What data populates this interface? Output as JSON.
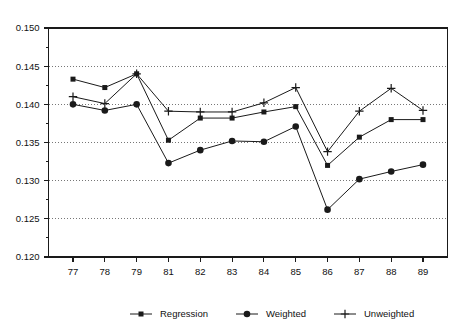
{
  "chart_data": {
    "type": "line",
    "title": "",
    "subtitle": "",
    "xlabel": "",
    "ylabel": "",
    "categories": [
      "77",
      "78",
      "79",
      "81",
      "82",
      "83",
      "84",
      "85",
      "86",
      "87",
      "88",
      "89"
    ],
    "x_tick_labels": [
      "77",
      "78",
      "79",
      "81",
      "82",
      "83",
      "84",
      "85",
      "86",
      "87",
      "88",
      "89"
    ],
    "y_tick_labels": [
      "0.120",
      "0.125",
      "0.130",
      "0.135",
      "0.140",
      "0.145",
      "0.150"
    ],
    "y_tick_values": [
      0.12,
      0.125,
      0.13,
      0.135,
      0.14,
      0.145,
      0.15
    ],
    "y_minor_tick_values": [
      0.1225,
      0.1275,
      0.1325,
      0.1375,
      0.1425,
      0.1475
    ],
    "ylim": [
      0.12,
      0.15
    ],
    "grid": true,
    "grid_axis": "y",
    "legend_position": "bottom",
    "series": [
      {
        "name": "Regression",
        "marker": "square",
        "values": [
          0.1433,
          0.1422,
          0.144,
          0.1353,
          0.1382,
          0.1382,
          0.139,
          0.1397,
          0.132,
          0.1357,
          0.138,
          0.138
        ]
      },
      {
        "name": "Weighted",
        "marker": "circle",
        "values": [
          0.14,
          0.1392,
          0.14,
          0.1323,
          0.134,
          0.1352,
          0.1351,
          0.1371,
          0.1262,
          0.1302,
          0.1312,
          0.1321
        ]
      },
      {
        "name": "Unweighted",
        "marker": "plus",
        "values": [
          0.141,
          0.1401,
          0.144,
          0.1391,
          0.139,
          0.139,
          0.1402,
          0.1422,
          0.1338,
          0.1391,
          0.1421,
          0.1392
        ]
      }
    ]
  },
  "legend": {
    "items": [
      {
        "label": "Regression",
        "marker": "square"
      },
      {
        "label": "Weighted",
        "marker": "circle"
      },
      {
        "label": "Unweighted",
        "marker": "plus"
      }
    ]
  },
  "colors": {
    "ink": "#1a1a1a",
    "grid": "#555555",
    "background": "#ffffff"
  }
}
